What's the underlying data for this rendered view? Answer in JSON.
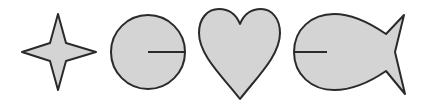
{
  "figure": {
    "background": "#ffffff",
    "fill_color": "#d4d4d4",
    "stroke_color": "#2a2a2a",
    "shapes": [
      {
        "name": "four-point-star",
        "label": "star"
      },
      {
        "name": "circle-with-radius",
        "label": "circle"
      },
      {
        "name": "heart",
        "label": "heart"
      },
      {
        "name": "fish",
        "label": "fish"
      }
    ]
  }
}
